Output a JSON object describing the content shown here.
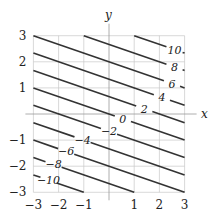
{
  "chart_data": {
    "type": "contour",
    "function": "x + 3y",
    "title": "",
    "xlabel": "x",
    "ylabel": "y",
    "xlim": [
      -3,
      3
    ],
    "ylim": [
      -3,
      3
    ],
    "grid": true,
    "x_ticks": [
      "-3",
      "-2",
      "-1",
      "1",
      "2",
      "3"
    ],
    "y_ticks": [
      "3",
      "2",
      "1",
      "-1",
      "-2",
      "-3"
    ],
    "levels": [
      -10,
      -8,
      -6,
      -4,
      -2,
      0,
      2,
      4,
      6,
      8,
      10
    ],
    "labeled_levels": [
      "10",
      "8",
      "6",
      "4",
      "2",
      "0",
      "-2",
      "-4",
      "-6",
      "-8",
      "-10"
    ]
  }
}
